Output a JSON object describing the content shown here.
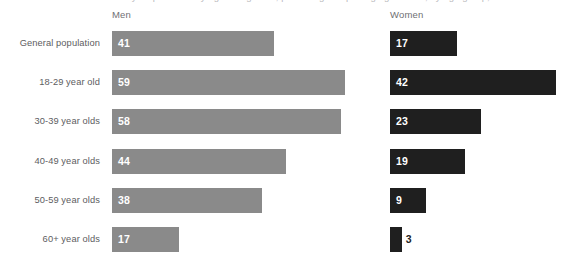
{
  "clipped_caption": "survey respondents by age and gender, percentages reporting agreement, by age group, men and women",
  "columns": [
    {
      "key": "men",
      "label": "Men",
      "color": "#8a8a8a"
    },
    {
      "key": "women",
      "label": "Women",
      "color": "#1f1f1f"
    }
  ],
  "chart_data": {
    "type": "bar",
    "title": "",
    "subtitle": "",
    "xlabel": "",
    "ylabel": "",
    "orientation": "horizontal",
    "grid": false,
    "legend_position": "top-as-column-headers",
    "xlim": [
      0,
      60
    ],
    "categories": [
      "General population",
      "18-29 year old",
      "30-39 year olds",
      "40-49 year olds",
      "50-59 year olds",
      "60+ year olds"
    ],
    "series": [
      {
        "name": "Men",
        "color": "#8a8a8a",
        "values": [
          41,
          59,
          58,
          44,
          38,
          17
        ]
      },
      {
        "name": "Women",
        "color": "#1f1f1f",
        "values": [
          17,
          42,
          23,
          19,
          9,
          3
        ]
      }
    ],
    "data_labels": {
      "men": [
        "41",
        "59",
        "58",
        "44",
        "38",
        "17"
      ],
      "women": [
        "17",
        "42",
        "23",
        "19",
        "9",
        "3"
      ]
    },
    "label_placement": {
      "men": [
        "inside",
        "inside",
        "inside",
        "inside",
        "inside",
        "inside"
      ],
      "women": [
        "inside",
        "inside",
        "inside",
        "inside",
        "inside",
        "outside"
      ]
    }
  },
  "scale": {
    "px_per_unit": 3.95,
    "men_origin_px": 112,
    "women_origin_px": 390
  }
}
